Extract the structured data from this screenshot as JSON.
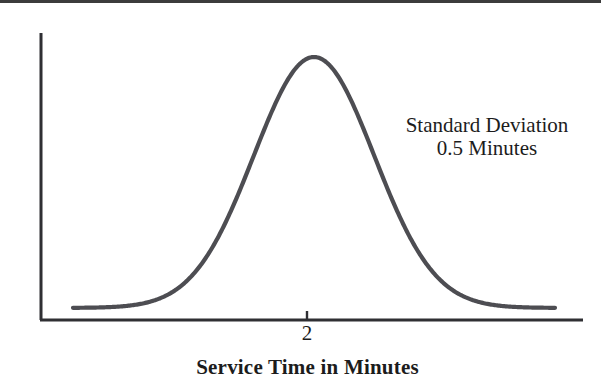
{
  "figure": {
    "width": 601,
    "height": 390,
    "background": "#ffffff",
    "ink_color": "#4d4d52",
    "text_color": "#1c1c1c"
  },
  "annotation": {
    "line1": "Standard Deviation",
    "line2": "0.5 Minutes"
  },
  "axis": {
    "x_title": "Service Time in Minutes",
    "x_tick_label": "2"
  },
  "chart_data": {
    "type": "line",
    "title": "",
    "subtitle": "",
    "xlabel": "Service Time in Minutes",
    "ylabel": "",
    "grid": false,
    "legend": null,
    "distribution": "normal",
    "mean": 2,
    "std_dev": 0.5,
    "std_dev_units": "Minutes",
    "xticks": [
      2
    ],
    "xticklabels": [
      "2"
    ],
    "yticks": [],
    "yticklabels": [],
    "xlim": [
      0.0,
      4.0
    ],
    "ylim": [
      0,
      0.82
    ],
    "annotations": [
      {
        "text": "Standard Deviation",
        "x": 3.5,
        "y": 0.52
      },
      {
        "text": "0.5 Minutes",
        "x": 3.5,
        "y": 0.45
      }
    ],
    "x": [
      0.0,
      0.1,
      0.2,
      0.3,
      0.4,
      0.5,
      0.6,
      0.7,
      0.8,
      0.9,
      1.0,
      1.1,
      1.2,
      1.3,
      1.4,
      1.5,
      1.6,
      1.7,
      1.8,
      1.9,
      2.0,
      2.1,
      2.2,
      2.3,
      2.4,
      2.5,
      2.6,
      2.7,
      2.8,
      2.9,
      3.0,
      3.1,
      3.2,
      3.3,
      3.4,
      3.5,
      3.6,
      3.7,
      3.8,
      3.9,
      4.0
    ],
    "y": [
      0.0,
      0.001,
      0.001,
      0.002,
      0.004,
      0.009,
      0.018,
      0.033,
      0.058,
      0.097,
      0.151,
      0.222,
      0.31,
      0.411,
      0.516,
      0.614,
      0.695,
      0.749,
      0.773,
      0.766,
      0.733,
      0.678,
      0.612,
      0.541,
      0.47,
      0.404,
      0.344,
      0.291,
      0.245,
      0.205,
      0.171,
      0.142,
      0.117,
      0.096,
      0.078,
      0.064,
      0.052,
      0.042,
      0.033,
      0.027,
      0.021
    ],
    "note": "y values are the normalized bell-curve heights read off the figure (peak normalized near 1.0 at x=2); the drawn curve is a symmetric normal density with mean 2 and sigma 0.5 scaled to the plot height."
  }
}
